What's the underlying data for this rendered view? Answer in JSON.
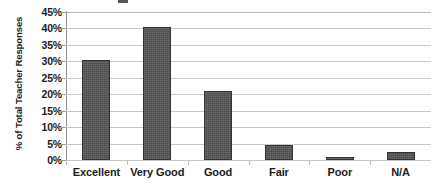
{
  "chart_data": {
    "type": "bar",
    "title": "",
    "title_cropped": true,
    "xlabel": "",
    "ylabel": "% of Total Teacher Responses",
    "categories": [
      "Excellent",
      "Very Good",
      "Good",
      "Fair",
      "Poor",
      "N/A"
    ],
    "values": [
      30.5,
      40.5,
      21.0,
      4.5,
      1.0,
      2.3
    ],
    "ylim": [
      0,
      45
    ],
    "ytick_values": [
      0,
      5,
      10,
      15,
      20,
      25,
      30,
      35,
      40,
      45
    ],
    "ytick_labels": [
      "0%",
      "5%",
      "10%",
      "15%",
      "20%",
      "25%",
      "30%",
      "35%",
      "40%",
      "45%"
    ],
    "grid": true,
    "grid_axis": "y",
    "legend": false,
    "series": [
      {
        "name": "% of Total Teacher Responses",
        "values": [
          30.5,
          40.5,
          21.0,
          4.5,
          1.0,
          2.3
        ]
      }
    ],
    "colors": {
      "bar_fill": "#4b4b4b",
      "bar_border": "#343434",
      "gridline": "#c8c8c8",
      "axis_line": "#8d8d8d",
      "text": "#1c1c1c",
      "background": "#ffffff"
    }
  }
}
